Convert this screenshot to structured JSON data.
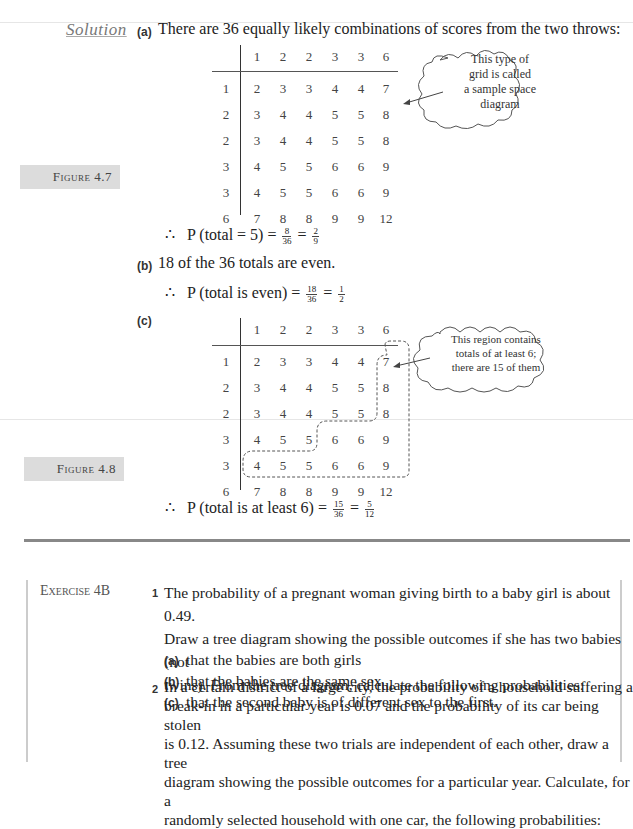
{
  "solution": {
    "heading": "Solution",
    "part_a": {
      "label": "(a)",
      "text": "There are 36 equally likely combinations of scores from the two throws:",
      "result_prefix": "∴",
      "result_text": "P (total = 5) =",
      "frac1": {
        "num": "8",
        "den": "36"
      },
      "eq": "=",
      "frac2": {
        "num": "2",
        "den": "9"
      }
    },
    "part_b": {
      "label": "(b)",
      "text": "18 of the 36 totals are even.",
      "result_prefix": "∴",
      "result_text": "P (total is even) =",
      "frac1": {
        "num": "18",
        "den": "36"
      },
      "eq": "=",
      "frac2": {
        "num": "1",
        "den": "2"
      }
    },
    "part_c": {
      "label": "(c)",
      "result_prefix": "∴",
      "result_text": "P (total is at least 6) =",
      "frac1": {
        "num": "15",
        "den": "36"
      },
      "eq": "=",
      "frac2": {
        "num": "5",
        "den": "12"
      }
    }
  },
  "figure_4_7": {
    "label": "Figure 4.7",
    "callout": [
      "This type of",
      "grid is called",
      "a sample space",
      "diagram"
    ],
    "col_headers": [
      "1",
      "2",
      "2",
      "3",
      "3",
      "6"
    ],
    "row_headers": [
      "1",
      "2",
      "2",
      "3",
      "3",
      "6"
    ],
    "rows": [
      [
        "2",
        "3",
        "3",
        "4",
        "4",
        "7"
      ],
      [
        "3",
        "4",
        "4",
        "5",
        "5",
        "8"
      ],
      [
        "3",
        "4",
        "4",
        "5",
        "5",
        "8"
      ],
      [
        "4",
        "5",
        "5",
        "6",
        "6",
        "9"
      ],
      [
        "4",
        "5",
        "5",
        "6",
        "6",
        "9"
      ],
      [
        "7",
        "8",
        "8",
        "9",
        "9",
        "12"
      ]
    ]
  },
  "figure_4_8": {
    "label": "Figure 4.8",
    "callout": [
      "This region contains",
      "totals of at least 6;",
      "there are 15 of them"
    ],
    "col_headers": [
      "1",
      "2",
      "2",
      "3",
      "3",
      "6"
    ],
    "row_headers": [
      "1",
      "2",
      "2",
      "3",
      "3",
      "6"
    ],
    "rows": [
      [
        "2",
        "3",
        "3",
        "4",
        "4",
        "7"
      ],
      [
        "3",
        "4",
        "4",
        "5",
        "5",
        "8"
      ],
      [
        "3",
        "4",
        "4",
        "5",
        "5",
        "8"
      ],
      [
        "4",
        "5",
        "5",
        "6",
        "6",
        "9"
      ],
      [
        "4",
        "5",
        "5",
        "6",
        "6",
        "9"
      ],
      [
        "7",
        "8",
        "8",
        "9",
        "9",
        "12"
      ]
    ]
  },
  "exercise": {
    "label": "Exercise 4B",
    "q1": {
      "num": "1",
      "lines": [
        "The probability of a pregnant woman giving birth to a baby girl is about 0.49.",
        "Draw a tree diagram showing the possible outcomes if she has two babies (not",
        "twins). From the tree diagram, calculate the following probabilities:"
      ],
      "parts": [
        {
          "label": "(a)",
          "text": "that the babies are both girls"
        },
        {
          "label": "(b)",
          "text": "that the babies are the same sex"
        },
        {
          "label": "(c)",
          "text": "that the second baby is of different sex to the first."
        }
      ]
    },
    "q2": {
      "num": "2",
      "lines": [
        "In a certain district of a large city, the probability of a household suffering a",
        "break-in in a particular year is 0.07 and the probability of its car being stolen",
        "is 0.12. Assuming these two trials are independent of each other, draw a tree",
        "diagram showing the possible outcomes for a particular year. Calculate, for a",
        "randomly selected household with one car, the following probabilities:"
      ]
    }
  }
}
